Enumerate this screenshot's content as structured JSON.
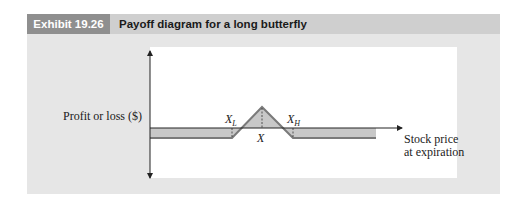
{
  "header": {
    "exhibit_number": "Exhibit 19.26",
    "title": "Payoff diagram for a long butterfly"
  },
  "diagram": {
    "y_axis_label": "Profit or loss ($)",
    "x_axis_label_line1": "Stock price",
    "x_axis_label_line2": "at expiration",
    "strike_low_label": "X",
    "strike_low_sub": "L",
    "strike_mid_label": "X",
    "strike_high_label": "X",
    "strike_high_sub": "H",
    "colors": {
      "fill": "#c8c8c8",
      "payoff_line": "#7a7a7a",
      "axis": "#222222"
    }
  }
}
